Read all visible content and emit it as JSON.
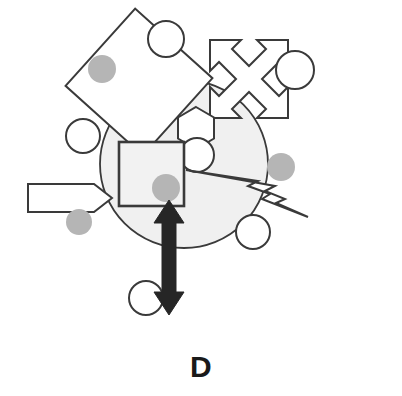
{
  "figure": {
    "panel_label": "D",
    "background_color": "#ffffff",
    "outline_color": "#3a3a3a",
    "fill_white": "#ffffff",
    "blob_fill": "#f0f0f0",
    "dot_fill": "#b5b5b5",
    "dark_arrow_fill": "#262626",
    "canvas": {
      "width": 402,
      "height": 396
    }
  },
  "shapes": {
    "big_blob": {
      "name": "large-gray-circle",
      "cx": 184,
      "cy": 164,
      "r": 84,
      "fill": "#f0f0f0",
      "stroke": "#3a3a3a"
    },
    "diamond": {
      "name": "rotated-square-diamond",
      "cx": 139,
      "cy": 82,
      "half": 52,
      "rotation_deg": 42,
      "fill": "#ffffff",
      "stroke": "#3a3a3a"
    },
    "center_square": {
      "name": "center-square",
      "x": 119,
      "y": 142,
      "width": 65,
      "height": 64,
      "fill": "#f2f2f2",
      "stroke": "#3a3a3a"
    },
    "hexagon": {
      "name": "hexagon",
      "cx": 196,
      "cy": 128,
      "r": 20,
      "fill": "#ffffff",
      "stroke": "#3a3a3a"
    },
    "cross_arrow": {
      "name": "four-way-diagonal-arrow",
      "cx": 244,
      "cy": 78,
      "fill": "#ffffff",
      "stroke": "#3a3a3a"
    },
    "left_banner_arrow": {
      "name": "left-horizontal-arrow",
      "x": 28,
      "y": 184,
      "width": 80,
      "height": 28,
      "fill": "#ffffff",
      "stroke": "#3a3a3a"
    },
    "lightning_bolt": {
      "name": "lightning-bolt",
      "fill": "#ffffff",
      "stroke": "#3a3a3a"
    },
    "double_arrow": {
      "name": "vertical-double-headed-arrow",
      "x_center": 169,
      "y_top": 200,
      "y_bottom": 315,
      "shaft_width": 14,
      "head_width": 30,
      "fill": "#262626"
    }
  },
  "open_circles": [
    {
      "name": "open-circle-top",
      "cx": 166,
      "cy": 39,
      "r": 18
    },
    {
      "name": "open-circle-top-right",
      "cx": 295,
      "cy": 70,
      "r": 19
    },
    {
      "name": "open-circle-left",
      "cx": 83,
      "cy": 136,
      "r": 17
    },
    {
      "name": "open-circle-center",
      "cx": 197,
      "cy": 155,
      "r": 17
    },
    {
      "name": "open-circle-right-lower",
      "cx": 253,
      "cy": 232,
      "r": 17
    },
    {
      "name": "open-circle-bottom",
      "cx": 146,
      "cy": 298,
      "r": 17
    }
  ],
  "gray_dots": [
    {
      "name": "gray-dot-upper-left",
      "cx": 102,
      "cy": 69,
      "r": 14
    },
    {
      "name": "gray-dot-center",
      "cx": 166,
      "cy": 188,
      "r": 14
    },
    {
      "name": "gray-dot-lower-left",
      "cx": 79,
      "cy": 222,
      "r": 13
    },
    {
      "name": "gray-dot-right",
      "cx": 281,
      "cy": 167,
      "r": 14
    }
  ]
}
